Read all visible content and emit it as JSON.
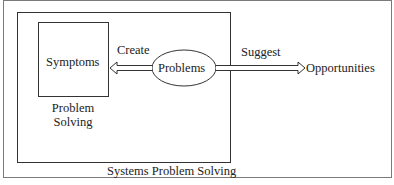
{
  "diagram": {
    "nodes": {
      "symptoms": "Symptoms",
      "problems": "Problems",
      "opportunities": "Opportunities"
    },
    "edges": {
      "create": "Create",
      "suggest": "Suggest"
    },
    "captions": {
      "problem_solving_line1": "Problem",
      "problem_solving_line2": "Solving",
      "systems_problem_solving": "Systems Problem Solving"
    },
    "colors": {
      "line": "#333333",
      "frame": "#777777",
      "background": "#ffffff"
    }
  }
}
